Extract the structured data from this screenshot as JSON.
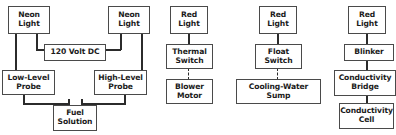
{
  "diagram": {
    "colors": {
      "background": "#ffffff",
      "box_border": "#4a4a4a",
      "wire": "#2b2b2b",
      "text": "#1b1b1b"
    },
    "columns": [
      {
        "name": "fuel-solution-level-circuit",
        "nodes": [
          {
            "id": "neon-light-left",
            "label": "Neon\nLight"
          },
          {
            "id": "neon-light-right",
            "label": "Neon\nLight"
          },
          {
            "id": "power-supply",
            "label": "120  Volt  DC"
          },
          {
            "id": "low-level-probe",
            "label": "Low-Level\nProbe"
          },
          {
            "id": "high-level-probe",
            "label": "High-Level\nProbe"
          },
          {
            "id": "fuel-solution",
            "label": "Fuel\nSolution"
          }
        ],
        "connectors": [
          {
            "from": "neon-light-left",
            "to": "low-level-probe",
            "style": "solid"
          },
          {
            "from": "neon-light-left",
            "to": "power-supply",
            "style": "solid"
          },
          {
            "from": "neon-light-right",
            "to": "high-level-probe",
            "style": "solid"
          },
          {
            "from": "neon-light-right",
            "to": "power-supply",
            "style": "solid"
          },
          {
            "from": "low-level-probe",
            "to": "fuel-solution",
            "style": "solid"
          },
          {
            "from": "high-level-probe",
            "to": "fuel-solution",
            "style": "solid"
          }
        ]
      },
      {
        "name": "thermal-switch-circuit",
        "nodes": [
          {
            "id": "red-light-2",
            "label": "Red\nLight"
          },
          {
            "id": "thermal-switch",
            "label": "Thermal\nSwitch"
          },
          {
            "id": "blower-motor",
            "label": "Blower\nMotor"
          }
        ],
        "connectors": [
          {
            "from": "red-light-2",
            "to": "thermal-switch",
            "style": "solid"
          },
          {
            "from": "thermal-switch",
            "to": "blower-motor",
            "style": "dashed"
          }
        ]
      },
      {
        "name": "float-switch-circuit",
        "nodes": [
          {
            "id": "red-light-3",
            "label": "Red\nLight"
          },
          {
            "id": "float-switch",
            "label": "Float\nSwitch"
          },
          {
            "id": "cooling-water-sump",
            "label": "Cooling-Water\nSump"
          }
        ],
        "connectors": [
          {
            "from": "red-light-3",
            "to": "float-switch",
            "style": "solid"
          },
          {
            "from": "float-switch",
            "to": "cooling-water-sump",
            "style": "dashed"
          }
        ]
      },
      {
        "name": "conductivity-circuit",
        "clipped_at_right_edge": true,
        "nodes": [
          {
            "id": "red-light-4",
            "label": "Red\nLight"
          },
          {
            "id": "blinker",
            "label": "Blinker"
          },
          {
            "id": "conductivity-bridge",
            "label": "Conductivity\nBridge"
          },
          {
            "id": "conductivity-cell",
            "label": "Conductivity\nCell"
          }
        ],
        "connectors": [
          {
            "from": "red-light-4",
            "to": "blinker",
            "style": "solid"
          },
          {
            "from": "blinker",
            "to": "conductivity-bridge",
            "style": "solid"
          },
          {
            "from": "conductivity-bridge",
            "to": "conductivity-cell",
            "style": "solid"
          }
        ]
      }
    ]
  }
}
